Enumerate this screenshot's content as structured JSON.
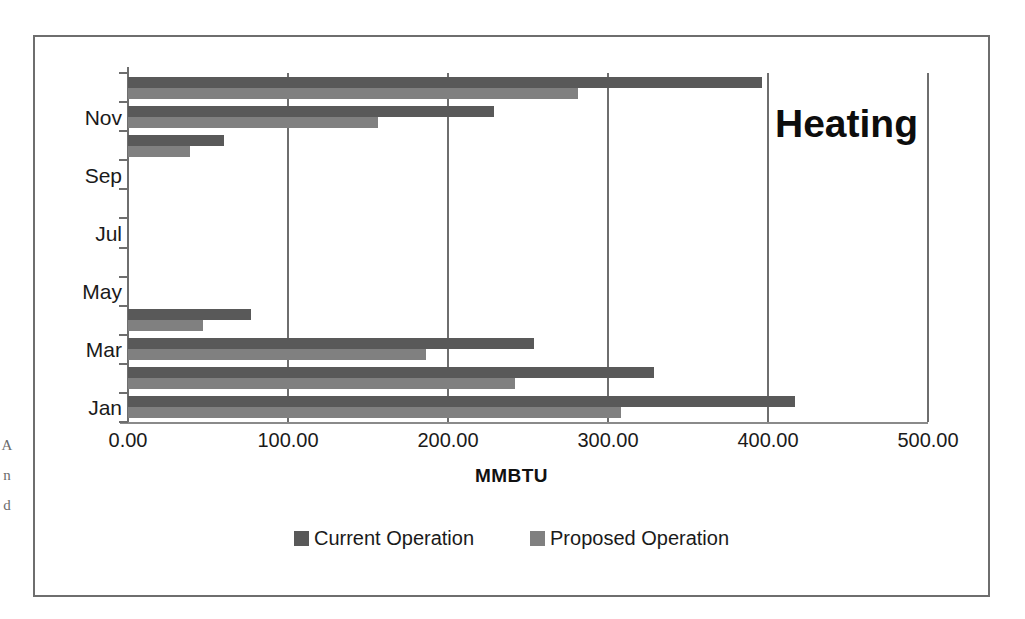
{
  "chart_data": {
    "type": "bar",
    "orientation": "horizontal",
    "title": "Heating",
    "xlabel": "MMBTU",
    "ylabel": "",
    "categories": [
      "Jan",
      "Feb",
      "Mar",
      "Apr",
      "May",
      "Jun",
      "Jul",
      "Aug",
      "Sep",
      "Oct",
      "Nov",
      "Dec"
    ],
    "visible_tick_labels": [
      "Jan",
      "Mar",
      "May",
      "Jul",
      "Sep",
      "Nov"
    ],
    "series": [
      {
        "name": "Current Operation",
        "color": "#595959",
        "values": [
          417,
          329,
          254,
          77,
          0,
          0,
          0,
          0,
          0,
          60,
          229,
          396
        ]
      },
      {
        "name": "Proposed Operation",
        "color": "#808080",
        "values": [
          308,
          242,
          186,
          47,
          0,
          0,
          0,
          0,
          0,
          39,
          156,
          281
        ]
      }
    ],
    "xticks": [
      "0.00",
      "100.00",
      "200.00",
      "300.00",
      "400.00",
      "500.00"
    ],
    "xtick_values": [
      0,
      100,
      200,
      300,
      400,
      500
    ],
    "xlim": [
      0,
      500
    ],
    "grid": "vertical",
    "legend_position": "bottom"
  },
  "scan_marks": "A\nn\nd"
}
